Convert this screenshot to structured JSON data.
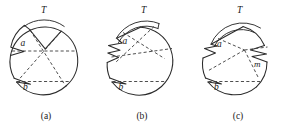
{
  "figure": {
    "type": "line-diagram",
    "background_color": "#ffffff",
    "stroke_color": "#2b2b2b",
    "dash_color": "#3a3a3a",
    "panels": [
      {
        "caption": "(a)",
        "labels": {
          "top": "T",
          "left_upper": "a",
          "left_lower": "b"
        },
        "center": [
          44,
          61
        ],
        "radius": 34,
        "notch_count": 3,
        "chord_count": 4
      },
      {
        "caption": "(b)",
        "labels": {
          "top": "T",
          "left_upper": "a",
          "left_lower": "b"
        },
        "center": [
          143,
          61
        ],
        "radius": 34,
        "notch_count": 3,
        "chord_count": 4
      },
      {
        "caption": "(c)",
        "labels": {
          "top": "T",
          "left_upper": "a",
          "left_lower": "b",
          "right": "m"
        },
        "center": [
          242,
          61
        ],
        "radius": 34,
        "notch_count": 4,
        "chord_count": 4
      }
    ]
  }
}
